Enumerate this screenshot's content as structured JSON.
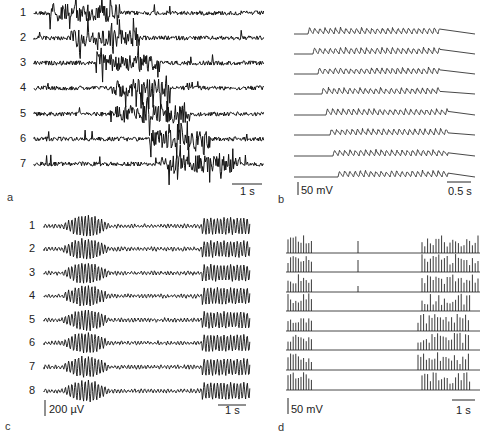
{
  "figure": {
    "panels": [
      {
        "id": "a",
        "label": "a",
        "trace_labels": [
          "1",
          "2",
          "3",
          "4",
          "5",
          "6",
          "7"
        ],
        "trace_type": "extracellular multiunit / field (dense noise with burst)",
        "scale_time": "1 s",
        "trace_count": 7,
        "burst_progression": "burst shifts later from trace 1 to trace 7"
      },
      {
        "id": "b",
        "label": "b",
        "trace_labels": [],
        "trace_type": "intracellular membrane potential oscillations",
        "scale_voltage": "50 mV",
        "scale_time": "0.5 s",
        "trace_count": 8,
        "burst_progression": "oscillation onset shifts later from top to bottom"
      },
      {
        "id": "c",
        "label": "c",
        "trace_labels": [
          "1",
          "2",
          "3",
          "4",
          "5",
          "6",
          "7",
          "8"
        ],
        "trace_type": "field potential spindle oscillations",
        "scale_voltage": "200 µV",
        "scale_time": "1 s",
        "trace_count": 8
      },
      {
        "id": "d",
        "label": "d",
        "trace_labels": [],
        "trace_type": "intracellular spike bursts",
        "scale_voltage": "50 mV",
        "scale_time": "1 s",
        "trace_count": 8
      }
    ]
  }
}
